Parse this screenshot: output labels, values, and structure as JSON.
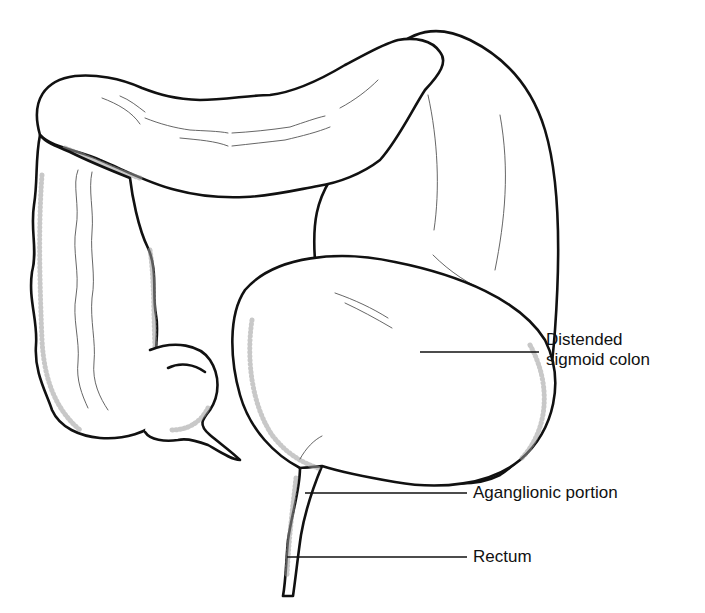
{
  "figure": {
    "style": "black-and-white line drawing",
    "colors": {
      "background": "#ffffff",
      "ink": "#111111",
      "fold_lines": "#555555"
    }
  },
  "labels": [
    {
      "id": "distended-sigmoid-colon",
      "lines": [
        "Distended",
        "sigmoid colon"
      ]
    },
    {
      "id": "aganglionic-portion",
      "lines": [
        "Aganglionic portion"
      ]
    },
    {
      "id": "rectum",
      "lines": [
        "Rectum"
      ]
    }
  ]
}
